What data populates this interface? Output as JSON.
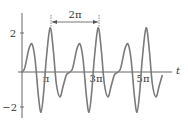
{
  "chart_data": {
    "type": "line",
    "title": "",
    "xlabel": "t",
    "ylabel": "",
    "x_tick_labels": [
      "π",
      "3π",
      "5π"
    ],
    "x_tick_values": [
      3.1416,
      9.4248,
      15.708
    ],
    "y_tick_labels": [
      "2",
      "−2"
    ],
    "y_tick_values": [
      2,
      -2
    ],
    "annotation": {
      "text": "2π",
      "description": "period arrow spanning one peak to the next",
      "from_t": 3.66,
      "to_t": 9.94
    },
    "grid": false,
    "legend": null,
    "period": 6.2832,
    "series": [
      {
        "name": "f(t)",
        "color": "#7a7a7a",
        "description": "periodic waveform, one period of samples (t in units of π, y value); repeats 3 times from t=0 to ~4.8π",
        "one_period": {
          "t_over_pi": [
            0,
            0.1,
            0.2,
            0.3,
            0.42,
            0.55,
            0.68,
            0.79,
            0.9,
            1.02,
            1.17,
            1.3,
            1.43,
            1.58,
            1.72,
            1.85,
            2.0
          ],
          "y": [
            0,
            0.15,
            0.7,
            1.25,
            1.45,
            0.6,
            -1.2,
            -2.1,
            -1.1,
            0.8,
            2.3,
            1.2,
            -0.6,
            -1.3,
            -0.7,
            -0.15,
            0
          ]
        }
      }
    ],
    "xlim_over_pi": [
      -0.15,
      6.3
    ],
    "ylim": [
      -2.5,
      3.0
    ]
  }
}
